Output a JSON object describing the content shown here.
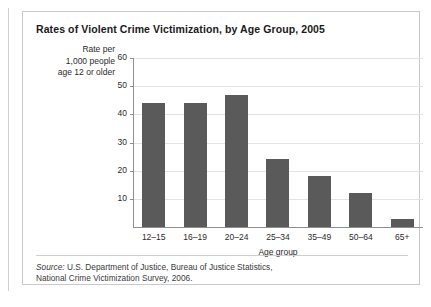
{
  "figure": {
    "title": "Rates of Violent Crime Victimization, by Age Group, 2005",
    "source_label": "Source:",
    "source_line1": " U.S. Department of Justice, Bureau of Justice Statistics,",
    "source_line2": "National Crime Victimization Survey, 2006."
  },
  "y_axis_title_lines": {
    "line1": "Rate per",
    "line2": "1,000 people",
    "line3": "age 12 or older"
  },
  "chart_data": {
    "type": "bar",
    "title": "Rates of Violent Crime Victimization, by Age Group, 2005",
    "categories": [
      "12–15",
      "16–19",
      "20–24",
      "25–34",
      "35–49",
      "50–64",
      "65+"
    ],
    "values": [
      44,
      44,
      47,
      24,
      18,
      12,
      3
    ],
    "xlabel": "Age group",
    "ylabel": "Rate per 1,000 people age 12 or older",
    "ylim": [
      0,
      60
    ],
    "yticks": [
      0,
      10,
      20,
      30,
      40,
      50,
      60
    ],
    "ytick_labels": [
      "",
      "10",
      "20",
      "30",
      "40",
      "50",
      "60"
    ],
    "grid": "horizontal",
    "legend": "none",
    "bar_color": "#5a5a5a",
    "gridline_color": "#e3e3e3",
    "axis_color": "#8f8f8f"
  }
}
